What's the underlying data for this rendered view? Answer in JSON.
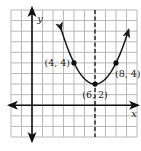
{
  "chart_data": {
    "type": "line",
    "title": "",
    "xlabel": "x",
    "ylabel": "y",
    "xlim": [
      -2,
      10
    ],
    "ylim": [
      -3,
      9
    ],
    "grid": true,
    "grid_step": 1,
    "axis_of_symmetry": {
      "x": 6,
      "style": "dashed"
    },
    "series": [
      {
        "name": "parabola",
        "equation": "y = 0.5*(x-6)^2 + 2",
        "vertex": [
          6,
          2
        ],
        "x_range": [
          2.8,
          9.2
        ],
        "arrows": true
      }
    ],
    "points": [
      {
        "x": 4,
        "y": 4,
        "label": "(4, 4)",
        "label_pos": "left"
      },
      {
        "x": 6,
        "y": 2,
        "label": "(6, 2)",
        "label_pos": "below"
      },
      {
        "x": 8,
        "y": 4,
        "label": "(8, 4)",
        "label_pos": "below-right"
      }
    ],
    "colors": {
      "grid": "#b8b8b8",
      "axis": "#111111",
      "curve": "#1a1a1a"
    }
  }
}
